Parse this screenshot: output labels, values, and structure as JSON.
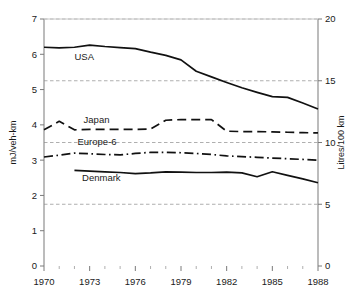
{
  "chart_data": {
    "type": "line",
    "title": "",
    "subtitle": "",
    "xlabel": "",
    "ylabel": "mJ/veh-km",
    "ylabel_right": "Litres/100 km",
    "xlim": [
      1970,
      1988
    ],
    "ylim": [
      0,
      7
    ],
    "ylim_right": [
      0,
      20
    ],
    "grid": "horizontal dashed gridlines at right-axis values 5, 10, 15, 20",
    "legend": "inline labels next to each line",
    "xticks": [
      1970,
      1973,
      1976,
      1979,
      1982,
      1985,
      1988
    ],
    "xticklabels": [
      "1970",
      "1973",
      "1976",
      "1979",
      "1982",
      "1985",
      "1988"
    ],
    "xminorticks": [
      1971,
      1972,
      1974,
      1975,
      1977,
      1978,
      1980,
      1981,
      1983,
      1984,
      1986,
      1987
    ],
    "yticks": [
      0,
      1,
      2,
      3,
      4,
      5,
      6,
      7
    ],
    "yticklabels": [
      "0",
      "1",
      "2",
      "3",
      "4",
      "5",
      "6",
      "7"
    ],
    "yticks_right": [
      0,
      5,
      10,
      15,
      20
    ],
    "yticklabels_right": [
      "0",
      "5",
      "10",
      "15",
      "20"
    ],
    "gridline_values_right": [
      5,
      10,
      15,
      20
    ],
    "series": [
      {
        "name": "USA",
        "style": "solid",
        "color": "#111111",
        "x": [
          1970,
          1971,
          1972,
          1973,
          1974,
          1975,
          1976,
          1977,
          1978,
          1979,
          1980,
          1981,
          1982,
          1983,
          1984,
          1985,
          1986,
          1987,
          1988
        ],
        "values": [
          6.2,
          6.18,
          6.2,
          6.26,
          6.22,
          6.19,
          6.16,
          6.06,
          5.97,
          5.84,
          5.52,
          5.36,
          5.2,
          5.05,
          4.92,
          4.8,
          4.78,
          4.62,
          4.45
        ],
        "label_x": 1972.0,
        "label_y": 5.85
      },
      {
        "name": "Japan",
        "style": "dashed",
        "color": "#111111",
        "x": [
          1970,
          1971,
          1972,
          1973,
          1974,
          1975,
          1976,
          1977,
          1978,
          1979,
          1980,
          1981,
          1982,
          1983,
          1984,
          1985,
          1986,
          1987,
          1988
        ],
        "values": [
          3.86,
          4.1,
          3.86,
          3.87,
          3.87,
          3.87,
          3.87,
          3.88,
          4.13,
          4.15,
          4.15,
          4.15,
          3.82,
          3.81,
          3.81,
          3.8,
          3.79,
          3.78,
          3.77
        ],
        "label_x": 1972.6,
        "label_y": 4.06
      },
      {
        "name": "Europe-6",
        "style": "dashdot",
        "color": "#111111",
        "x": [
          1970,
          1971,
          1972,
          1973,
          1974,
          1975,
          1976,
          1977,
          1978,
          1979,
          1980,
          1981,
          1982,
          1983,
          1984,
          1985,
          1986,
          1987,
          1988
        ],
        "values": [
          3.09,
          3.14,
          3.2,
          3.18,
          3.16,
          3.15,
          3.19,
          3.22,
          3.22,
          3.21,
          3.19,
          3.16,
          3.12,
          3.1,
          3.08,
          3.06,
          3.04,
          3.02,
          3.0
        ],
        "label_x": 1972.2,
        "label_y": 3.42
      },
      {
        "name": "Denmark",
        "style": "solid",
        "color": "#111111",
        "x": [
          1972,
          1973,
          1974,
          1975,
          1976,
          1977,
          1978,
          1979,
          1980,
          1981,
          1982,
          1983,
          1984,
          1985,
          1986,
          1987,
          1988
        ],
        "values": [
          2.71,
          2.69,
          2.67,
          2.65,
          2.62,
          2.64,
          2.67,
          2.66,
          2.65,
          2.65,
          2.66,
          2.64,
          2.53,
          2.67,
          2.57,
          2.47,
          2.36
        ],
        "label_x": 1972.5,
        "label_y": 2.42
      }
    ]
  },
  "axes": {
    "left_title": "mJ/veh-km",
    "right_title": "Litres/100 km"
  }
}
